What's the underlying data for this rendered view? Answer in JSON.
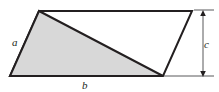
{
  "figure": {
    "name": "parallelogram-with-inscribed-shaded-triangle",
    "width": 219,
    "height": 92,
    "background_color": "#ffffff",
    "stroke_color": "#231f20",
    "shaded_fill_color": "#d8d8d8",
    "unshaded_fill_color": "#ffffff",
    "thin_line_color": "#58585b",
    "labels": {
      "side_a": "a",
      "side_b": "b",
      "height_c": "c"
    },
    "label_positions": {
      "side_a": {
        "x": 12,
        "y": 46
      },
      "side_b": {
        "x": 82,
        "y": 89
      },
      "height_c": {
        "x": 204,
        "y": 48
      }
    },
    "parallelogram": {
      "points": "39,11 192,11 163,76 10,76",
      "vertices": [
        {
          "name": "top-left",
          "x": 39,
          "y": 11
        },
        {
          "name": "top-right",
          "x": 192,
          "y": 11
        },
        {
          "name": "bottom-right",
          "x": 163,
          "y": 76
        },
        {
          "name": "bottom-left",
          "x": 10,
          "y": 76
        }
      ],
      "stroke_width": 2
    },
    "shaded_triangle": {
      "points": "39,11 10,76 163,76",
      "vertices": [
        {
          "name": "apex",
          "x": 39,
          "y": 11
        },
        {
          "name": "base-left",
          "x": 10,
          "y": 76
        },
        {
          "name": "base-right",
          "x": 163,
          "y": 76
        }
      ],
      "stroke_width": 2
    },
    "dimension_line": {
      "axis_x": 203,
      "top_y": 10,
      "bottom_y": 77,
      "stroke_width": 1,
      "arrow_size": 4,
      "extension_top": {
        "x1": 194,
        "y1": 10,
        "x2": 214,
        "y2": 10
      },
      "extension_bottom": {
        "x1": 164,
        "y1": 76,
        "x2": 214,
        "y2": 76
      }
    }
  }
}
